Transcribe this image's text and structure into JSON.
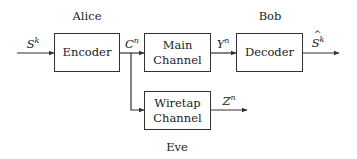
{
  "diagram": {
    "parties": {
      "alice": "Alice",
      "bob": "Bob",
      "eve": "Eve"
    },
    "blocks": {
      "encoder": {
        "line1": "Encoder"
      },
      "main_channel": {
        "line1": "Main",
        "line2": "Channel"
      },
      "decoder": {
        "line1": "Decoder"
      },
      "wiretap_channel": {
        "line1": "Wiretap",
        "line2": "Channel"
      }
    },
    "signals": {
      "source": {
        "base": "S",
        "sup": "k"
      },
      "codeword": {
        "base": "C",
        "sup": "n"
      },
      "main_output": {
        "base": "Y",
        "sup": "n"
      },
      "estimate": {
        "base": "S",
        "sup": "k",
        "hat": true
      },
      "eve_output": {
        "base": "Z",
        "sup": "n"
      }
    },
    "colors": {
      "stroke": "#333333",
      "background": "#ffffff"
    }
  }
}
